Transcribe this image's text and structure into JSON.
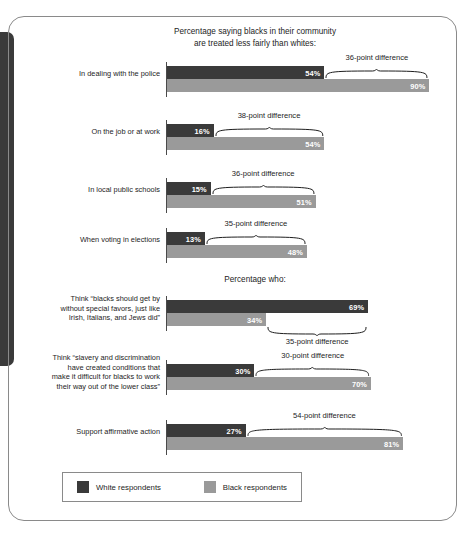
{
  "chart_data": {
    "type": "bar",
    "title": "Percentage saying blacks in their community\nare treated less fairly than whites:",
    "orientation": "horizontal-grouped",
    "xlabel": "",
    "ylabel": "",
    "xlim": [
      0,
      100
    ],
    "grid": false,
    "legend_position": "bottom",
    "series": [
      {
        "name": "White respondents",
        "color": "#3a3a3a"
      },
      {
        "name": "Black respondents",
        "color": "#9a9a9a"
      }
    ],
    "sections": [
      {
        "heading": "Percentage saying blacks in their community\nare treated less fairly than whites:",
        "rows": [
          {
            "category": "In dealing with the police",
            "white": 54,
            "black": 90,
            "white_label": "54%",
            "black_label": "90%",
            "difference": 36,
            "difference_label": "36-point difference",
            "brace_side": "above"
          },
          {
            "category": "On the job or at work",
            "white": 16,
            "black": 54,
            "white_label": "16%",
            "black_label": "54%",
            "difference": 38,
            "difference_label": "38-point difference",
            "brace_side": "above"
          },
          {
            "category": "In local public schools",
            "white": 15,
            "black": 51,
            "white_label": "15%",
            "black_label": "51%",
            "difference": 36,
            "difference_label": "36-point difference",
            "brace_side": "above"
          },
          {
            "category": "When voting in elections",
            "white": 13,
            "black": 48,
            "white_label": "13%",
            "black_label": "48%",
            "difference": 35,
            "difference_label": "35-point difference",
            "brace_side": "above"
          }
        ]
      },
      {
        "heading": "Percentage who:",
        "rows": [
          {
            "category": "Think “blacks should get by\nwithout special favors, just like\nIrish, Italians, and Jews did”",
            "white": 69,
            "black": 34,
            "white_label": "69%",
            "black_label": "34%",
            "difference": 35,
            "difference_label": "35-point difference",
            "brace_side": "below"
          },
          {
            "category": "Think “slavery and discrimination\nhave created conditions that\nmake it difficult for blacks to work\ntheir way out of the lower class”",
            "white": 30,
            "black": 70,
            "white_label": "30%",
            "black_label": "70%",
            "difference": 30,
            "difference_label": "30-point difference",
            "brace_side": "above"
          },
          {
            "category": "Support affirmative action",
            "white": 27,
            "black": 81,
            "white_label": "27%",
            "black_label": "81%",
            "difference": 54,
            "difference_label": "54-point difference",
            "brace_side": "above"
          }
        ]
      }
    ]
  },
  "headings": {
    "section1": "Percentage saying blacks in their community\nare treated less fairly than whites:",
    "section2": "Percentage who:"
  },
  "legend": {
    "white_label": "White respondents",
    "black_label": "Black respondents"
  },
  "colors": {
    "white_bar": "#3a3a3a",
    "black_bar": "#9a9a9a",
    "text": "#1d1d1d",
    "border": "#8a8a8a"
  }
}
